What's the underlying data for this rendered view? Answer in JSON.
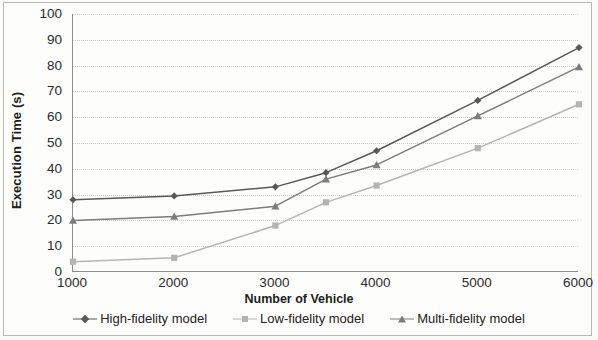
{
  "chart_data": {
    "type": "line",
    "title": "",
    "xlabel": "Number of Vehicle",
    "ylabel": "Execution Time (s)",
    "x": [
      1000,
      2000,
      3000,
      3500,
      4000,
      5000,
      6000
    ],
    "x_tick_labels": [
      "1000",
      "2000",
      "3000",
      "4000",
      "5000",
      "6000"
    ],
    "x_tick_values": [
      1000,
      2000,
      3000,
      4000,
      5000,
      6000
    ],
    "y_tick_labels": [
      "0",
      "10",
      "20",
      "30",
      "40",
      "50",
      "60",
      "70",
      "80",
      "90",
      "100"
    ],
    "y_tick_values": [
      0,
      10,
      20,
      30,
      40,
      50,
      60,
      70,
      80,
      90,
      100
    ],
    "ylim": [
      0,
      100
    ],
    "grid": "horizontal-dotted",
    "legend_position": "bottom",
    "series": [
      {
        "name": "High-fidelity model",
        "marker": "diamond",
        "color": "#58585a",
        "values": [
          28,
          29.5,
          33,
          38.5,
          47,
          66.5,
          87
        ]
      },
      {
        "name": "Low-fidelity model",
        "marker": "square",
        "color": "#b4b4b4",
        "values": [
          4,
          5.5,
          18,
          27,
          33.5,
          48,
          65
        ]
      },
      {
        "name": "Multi-fidelity model",
        "marker": "triangle",
        "color": "#7c7c7e",
        "values": [
          20,
          21.5,
          25.5,
          36,
          41.5,
          60.5,
          79.5
        ]
      }
    ]
  }
}
